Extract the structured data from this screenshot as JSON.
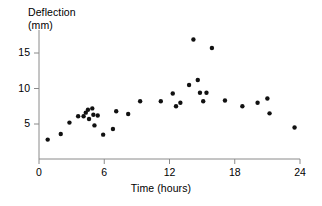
{
  "chart_data": {
    "type": "scatter",
    "title": "",
    "subtitle": "",
    "xlabel": "Time (hours)",
    "ylabel": "Deflection (mm)",
    "ylabel_line1": "Deflection",
    "ylabel_line2": "(mm)",
    "xlim": [
      0,
      24
    ],
    "ylim": [
      0,
      18
    ],
    "xticks": [
      0,
      6,
      12,
      18,
      24
    ],
    "xtick_labels": [
      "0",
      "6",
      "12",
      "18",
      "24"
    ],
    "yticks": [
      5,
      10,
      15
    ],
    "ytick_labels": [
      "5",
      "10",
      "15"
    ],
    "grid": false,
    "legend": null,
    "legend_position": "none",
    "marker": "circle",
    "marker_color": "#111111",
    "marker_size": 4.4,
    "axis_color": "#8a8a8a",
    "series": [
      {
        "name": "Deflection",
        "points": [
          [
            0.8,
            2.8
          ],
          [
            2.0,
            3.6
          ],
          [
            2.8,
            5.2
          ],
          [
            3.6,
            6.1
          ],
          [
            4.1,
            6.1
          ],
          [
            4.3,
            6.6
          ],
          [
            4.5,
            7.0
          ],
          [
            4.6,
            5.7
          ],
          [
            4.9,
            7.2
          ],
          [
            5.0,
            6.3
          ],
          [
            5.1,
            4.8
          ],
          [
            5.4,
            6.2
          ],
          [
            5.9,
            3.5
          ],
          [
            6.8,
            4.3
          ],
          [
            7.1,
            6.8
          ],
          [
            8.2,
            6.4
          ],
          [
            9.3,
            8.2
          ],
          [
            11.2,
            8.2
          ],
          [
            12.3,
            9.3
          ],
          [
            12.6,
            7.5
          ],
          [
            13.0,
            8.0
          ],
          [
            13.8,
            10.5
          ],
          [
            14.2,
            16.9
          ],
          [
            14.6,
            11.2
          ],
          [
            14.8,
            9.4
          ],
          [
            15.1,
            8.2
          ],
          [
            15.4,
            9.4
          ],
          [
            15.9,
            15.7
          ],
          [
            17.1,
            8.3
          ],
          [
            18.7,
            7.5
          ],
          [
            20.1,
            8.0
          ],
          [
            21.0,
            8.6
          ],
          [
            21.2,
            6.5
          ],
          [
            23.5,
            4.5
          ]
        ]
      }
    ]
  },
  "figure": {
    "geometry": {
      "plot_left_px": 39,
      "plot_right_px": 300,
      "plot_baseline_px": 159,
      "y_axis_top_px": 30,
      "y_5_px": 124,
      "y_10_px": 88,
      "y_15_px": 53
    }
  }
}
